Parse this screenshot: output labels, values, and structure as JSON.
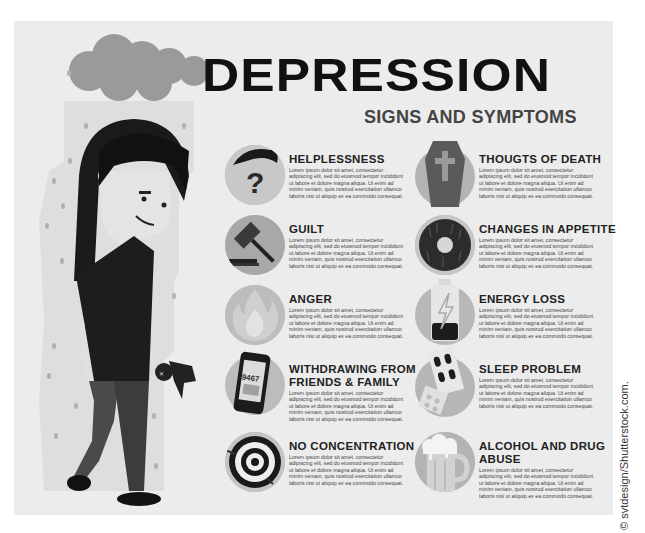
{
  "header": {
    "title": "DEPRESSION",
    "subtitle": "SIGNS AND  SYMPTOMS"
  },
  "lorem": "Lorem ipsum dolor sit amet, consectetur adipiscing elit, sed do eiusmod tempor incididunt ut labore et dolore magna aliqua. Ut enim ad minim veniam, quis nostrud exercitation ullamco laboris nisi ut aliquip ex ea commodo consequat.",
  "left_column": [
    {
      "title": "HELPLESSNESS",
      "icon": "question-face-icon",
      "body": "Lorem ipsum dolor sit amet, consectetur adipiscing elit, sed do eiusmod tempor incididunt ut labore et dolore magna aliqua. Ut enim ad minim veniam, quis nostrud exercitation ullamco laboris nisi ut aliquip ex ea commodo consequat."
    },
    {
      "title": "GUILT",
      "icon": "gavel-icon",
      "body": "Lorem ipsum dolor sit amet, consectetur adipiscing elit, sed do eiusmod tempor incididunt ut labore et dolore magna aliqua. Ut enim ad minim veniam, quis nostrud exercitation ullamco laboris nisi ut aliquip ex ea commodo consequat."
    },
    {
      "title": "ANGER",
      "icon": "fire-icon",
      "body": "Lorem ipsum dolor sit amet, consectetur adipiscing elit, sed do eiusmod tempor incididunt ut labore et dolore magna aliqua. Ut enim ad minim veniam, quis nostrud exercitation ullamco laboris nisi ut aliquip ex ea commodo consequat."
    },
    {
      "title": "WITHDRAWING FROM FRIENDS & FAMILY",
      "icon": "phone-icon",
      "phone_number": "9467",
      "body": "Lorem ipsum dolor sit amet, consectetur adipiscing elit, sed do eiusmod tempor incididunt ut labore et dolore magna aliqua. Ut enim ad minim veniam, quis nostrud exercitation ullamco laboris nisi ut aliquip ex ea commodo consequat."
    },
    {
      "title": "NO CONCENTRATION",
      "icon": "target-icon",
      "body": "Lorem ipsum dolor sit amet, consectetur adipiscing elit, sed do eiusmod tempor incididunt ut labore et dolore magna aliqua. Ut enim ad minim veniam, quis nostrud exercitation ullamco laboris nisi ut aliquip ex ea commodo consequat."
    }
  ],
  "right_column": [
    {
      "title": "THOUGTS OF DEATH",
      "icon": "coffin-icon",
      "body": "Lorem ipsum dolor sit amet, consectetur adipiscing elit, sed do eiusmod tempor incididunt ut labore et dolore magna aliqua. Ut enim ad minim veniam, quis nostrud exercitation ullamco laboris nisi ut aliquip ex ea commodo consequat."
    },
    {
      "title": "CHANGES IN APPETITE",
      "icon": "donut-icon",
      "body": "Lorem ipsum dolor sit amet, consectetur adipiscing elit, sed do eiusmod tempor incididunt ut labore et dolore magna aliqua. Ut enim ad minim veniam, quis nostrud exercitation ullamco laboris nisi ut aliquip ex ea commodo consequat."
    },
    {
      "title": "ENERGY LOSS",
      "icon": "low-battery-icon",
      "body": "Lorem ipsum dolor sit amet, consectetur adipiscing elit, sed do eiusmod tempor incididunt ut labore et dolore magna aliqua. Ut enim ad minim veniam, quis nostrud exercitation ullamco laboris nisi ut aliquip ex ea commodo consequat."
    },
    {
      "title": "SLEEP PROBLEM",
      "icon": "pills-icon",
      "body": "Lorem ipsum dolor sit amet, consectetur adipiscing elit, sed do eiusmod tempor incididunt ut labore et dolore magna aliqua. Ut enim ad minim veniam, quis nostrud exercitation ullamco laboris nisi ut aliquip ex ea commodo consequat."
    },
    {
      "title": "ALCOHOL AND DRUG ABUSE",
      "icon": "beer-mug-icon",
      "body": "Lorem ipsum dolor sit amet, consectetur adipiscing elit, sed do eiusmod tempor incididunt ut labore et dolore magna aliqua. Ut enim ad minim veniam, quis nostrud exercitation ullamco laboris nisi ut aliquip ex ea commodo consequat."
    }
  ],
  "illustration": {
    "description": "sad person under rain cloud holding voodoo doll"
  },
  "watermark": "© svtdesign/Shutterstock.com.",
  "colors": {
    "panel_bg": "#ececec",
    "icon_circle": "#b4b4b4",
    "title": "#111111",
    "subtitle": "#444444",
    "dark": "#1a1a1a"
  }
}
